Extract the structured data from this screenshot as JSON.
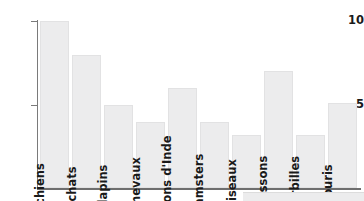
{
  "chart_data": {
    "type": "bar",
    "title": "",
    "subtitle": "",
    "xlabel": "",
    "ylabel": "",
    "categories": [
      "chiens",
      "chats",
      "lapins",
      "chevaux",
      "cochons d'Inde",
      "hamsters",
      "oiseaux",
      "poissons",
      "gerbilles",
      "souris"
    ],
    "values": [
      10,
      8,
      5,
      4,
      6,
      4,
      3.2,
      7,
      3.2,
      5.1
    ],
    "ylim": [
      0,
      10.5
    ],
    "yticks": [
      5,
      10
    ],
    "ytick_labels": [
      "5",
      "10"
    ],
    "xticks": [],
    "grid": false,
    "legend": null,
    "bar_color": "#ececed",
    "bar_border_color": "#e2e2e3",
    "axis_color": "#6e6e6e",
    "text_color": "#1a1a1a",
    "label_orientation": "vertical",
    "annotations": []
  },
  "axis": {
    "y_tick_10": "10",
    "y_tick_5": "5"
  },
  "bars": [
    {
      "label": "chiens",
      "value": 10
    },
    {
      "label": "chats",
      "value": 8
    },
    {
      "label": "lapins",
      "value": 5
    },
    {
      "label": "chevaux",
      "value": 4
    },
    {
      "label": "cochons d'Inde",
      "value": 6
    },
    {
      "label": "hamsters",
      "value": 4
    },
    {
      "label": "oiseaux",
      "value": 3.2
    },
    {
      "label": "poissons",
      "value": 7
    },
    {
      "label": "gerbilles",
      "value": 3.2
    },
    {
      "label": "souris",
      "value": 5.1
    }
  ]
}
